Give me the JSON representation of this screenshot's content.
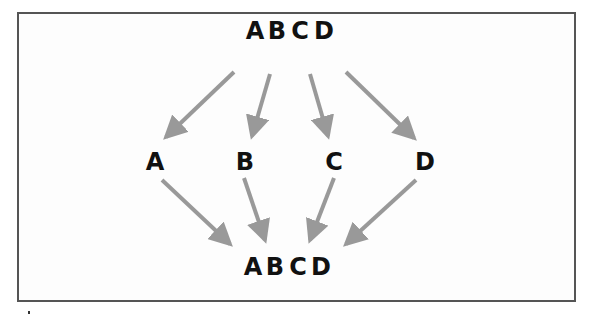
{
  "diagram": {
    "type": "split-merge",
    "colors": {
      "arrow": "#999999",
      "text": "#111111",
      "border": "#555555"
    },
    "top": {
      "label": "A B C D",
      "letters": [
        "A",
        "B",
        "C",
        "D"
      ]
    },
    "middle": {
      "nodes": [
        "A",
        "B",
        "C",
        "D"
      ]
    },
    "bottom": {
      "label": "A B C D",
      "letters": [
        "A",
        "B",
        "C",
        "D"
      ]
    },
    "edges": [
      {
        "from": "top",
        "to": "A"
      },
      {
        "from": "top",
        "to": "B"
      },
      {
        "from": "top",
        "to": "C"
      },
      {
        "from": "top",
        "to": "D"
      },
      {
        "from": "A",
        "to": "bottom"
      },
      {
        "from": "B",
        "to": "bottom"
      },
      {
        "from": "C",
        "to": "bottom"
      },
      {
        "from": "D",
        "to": "bottom"
      }
    ]
  }
}
